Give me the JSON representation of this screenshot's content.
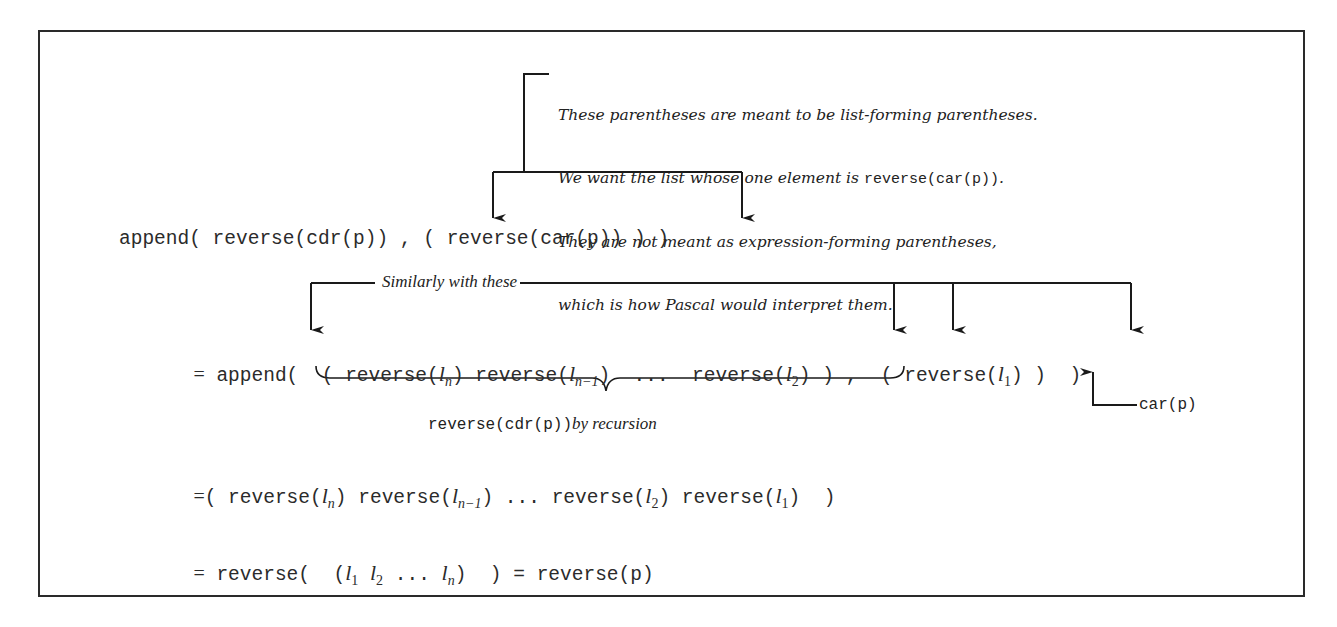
{
  "annotation_top": {
    "lines": [
      "These parentheses are meant to be list-forming parentheses.",
      "We want the list whose one element is ",
      "reverse(car(p))",
      ".",
      "They are not meant as expression-forming parentheses,",
      "which is how Pascal would interpret them."
    ]
  },
  "line1": {
    "text": "append( reverse(cdr(p)) , ( reverse(car(p)) ) )"
  },
  "annotation_similar": {
    "text": "Similarly with these"
  },
  "line2": {
    "eq": "=",
    "prefix": "append(  ( ",
    "rev": "reverse(",
    "close": ")",
    "l": "l",
    "sub_n": "n",
    "sub_n1": "n−1",
    "sub_2": "2",
    "sub_1": "1",
    "dots": "...",
    "list_close": " )",
    "comma": " ,  ( ",
    "tail": " )  )"
  },
  "brace_label": {
    "mono": "reverse(cdr(p))",
    "italic": "by recursion"
  },
  "car_label": {
    "text": "car(p)"
  },
  "line3": {
    "eq": "=",
    "open": "( ",
    "close": "  )"
  },
  "line4": {
    "eq": "=",
    "prefix": "reverse(  (",
    "mid": ")  ) = reverse(p)",
    "dots": "..."
  }
}
